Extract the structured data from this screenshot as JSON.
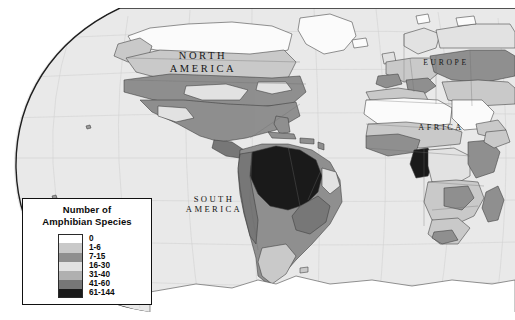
{
  "figure": {
    "kind": "thematic-choropleth-world-map",
    "projection_note": "curved elliptical world projection, grayscale print"
  },
  "chart_data": {
    "type": "heatmap",
    "title": "Number of Amphibian Species",
    "xlabel": "",
    "ylabel": "",
    "legend_position": "bottom-left",
    "grid": true,
    "categories": [
      "0",
      "1-6",
      "7-15",
      "16-30",
      "31-40",
      "41-60",
      "61-144"
    ],
    "values": [
      0,
      6,
      15,
      30,
      40,
      60,
      144
    ],
    "class_colors": [
      "#ffffff",
      "#c9c9c9",
      "#8f8f8f",
      "#e2e2e2",
      "#b0b0b0",
      "#777777",
      "#1a1a1a"
    ],
    "annotations": [
      "NORTH AMERICA",
      "SOUTH AMERICA",
      "EUROPE",
      "AFRICA"
    ],
    "regions": [
      {
        "name": "Amazon Basin",
        "class": "61-144"
      },
      {
        "name": "Atlantic Forest Brazil",
        "class": "41-60"
      },
      {
        "name": "Andes / Colombia",
        "class": "41-60"
      },
      {
        "name": "Cameroon - Gabon",
        "class": "61-144"
      },
      {
        "name": "Congo Basin",
        "class": "16-30"
      },
      {
        "name": "Eastern United States",
        "class": "16-30"
      },
      {
        "name": "Canada / Siberia",
        "class": "1-6"
      },
      {
        "name": "Sahara",
        "class": "0"
      },
      {
        "name": "Antarctica",
        "class": "0"
      }
    ]
  },
  "map": {
    "ocean_color": "#e9e9e9",
    "graticule_color": "#cfcfcf",
    "coastline_color": "#2b2b2b",
    "labels": {
      "north_america_line1": "NORTH",
      "north_america_line2": "AMERICA",
      "south_america_line1": "SOUTH",
      "south_america_line2": "AMERICA",
      "europe": "EUROPE",
      "africa": "AFRICA"
    }
  },
  "legend": {
    "title_line1": "Number of",
    "title_line2": "Amphibian Species",
    "items": [
      {
        "label": "0",
        "color": "#ffffff"
      },
      {
        "label": "1-6",
        "color": "#c9c9c9"
      },
      {
        "label": "7-15",
        "color": "#8f8f8f"
      },
      {
        "label": "16-30",
        "color": "#e2e2e2"
      },
      {
        "label": "31-40",
        "color": "#b0b0b0"
      },
      {
        "label": "41-60",
        "color": "#777777"
      },
      {
        "label": "61-144",
        "color": "#1a1a1a"
      }
    ]
  }
}
